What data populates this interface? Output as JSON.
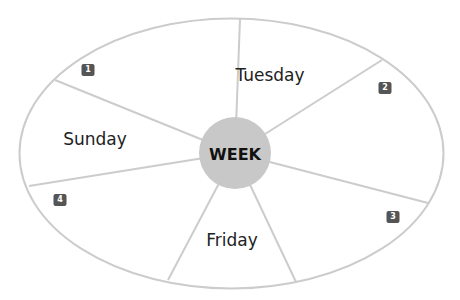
{
  "diagram": {
    "center_label": "WEEK",
    "colors": {
      "outline": "#cccccc",
      "hub_fill": "#c8c8c8",
      "badge_fill": "#555555",
      "badge_text": "#ffffff",
      "label_text": "#222222"
    },
    "segments": [
      {
        "label": "",
        "badge": "1"
      },
      {
        "label": "Tuesday",
        "badge": ""
      },
      {
        "label": "",
        "badge": "2"
      },
      {
        "label": "",
        "badge": "3"
      },
      {
        "label": "Friday",
        "badge": ""
      },
      {
        "label": "",
        "badge": "4"
      },
      {
        "label": "Sunday",
        "badge": ""
      }
    ],
    "labels": {
      "tuesday": "Tuesday",
      "sunday": "Sunday",
      "friday": "Friday"
    },
    "badges": {
      "b1": "1",
      "b2": "2",
      "b3": "3",
      "b4": "4"
    }
  }
}
